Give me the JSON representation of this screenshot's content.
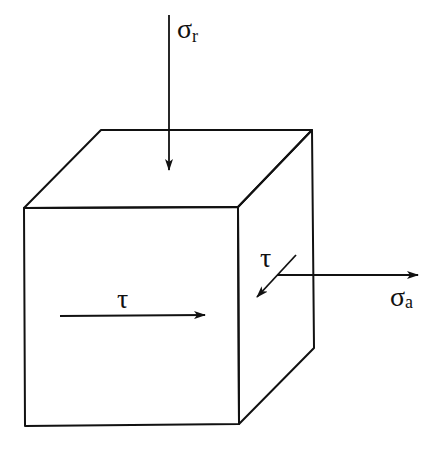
{
  "diagram": {
    "type": "stress-element-cube",
    "colors": {
      "line": "#111111",
      "background": "#ffffff"
    },
    "labels": {
      "radial_stress": {
        "symbol": "σ",
        "subscript": "r"
      },
      "axial_stress": {
        "symbol": "σ",
        "subscript": "a"
      },
      "shear_front": {
        "symbol": "τ"
      },
      "shear_side": {
        "symbol": "τ"
      }
    },
    "arrows": [
      {
        "name": "radial-stress-arrow",
        "direction": "down",
        "label": "σr"
      },
      {
        "name": "axial-stress-arrow",
        "direction": "right",
        "label": "σa"
      },
      {
        "name": "shear-front-arrow",
        "direction": "right",
        "label": "τ"
      },
      {
        "name": "shear-side-arrow",
        "direction": "down-left",
        "label": "τ"
      }
    ]
  }
}
